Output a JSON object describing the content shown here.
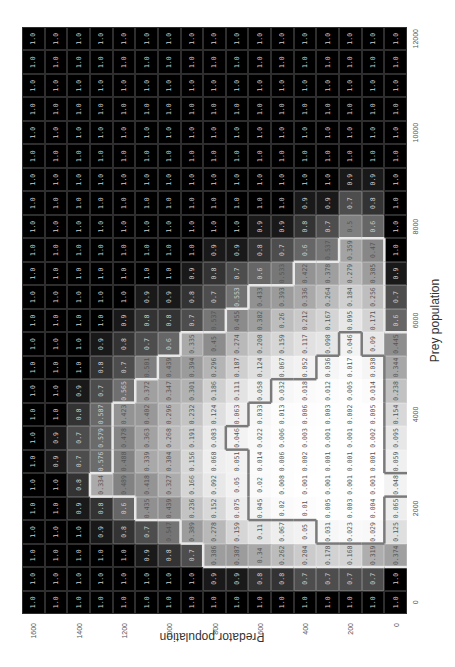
{
  "chart_data": {
    "type": "heatmap",
    "title": "",
    "xlabel": "Prey population",
    "ylabel": "Predator population",
    "x": [
      0,
      500,
      1000,
      1500,
      2000,
      2500,
      3000,
      3500,
      4000,
      4500,
      5000,
      5500,
      6000,
      6500,
      7000,
      7500,
      8000,
      8500,
      9000,
      9500,
      10000,
      10500,
      11000,
      11500,
      12000
    ],
    "y": [
      0,
      100,
      200,
      300,
      400,
      500,
      600,
      700,
      800,
      900,
      1000,
      1100,
      1200,
      1300,
      1400,
      1500,
      1600
    ],
    "xticks": [
      0,
      2000,
      4000,
      6000,
      8000,
      10000,
      12000
    ],
    "yticks": [
      0,
      200,
      400,
      600,
      800,
      1000,
      1200,
      1400,
      1600
    ],
    "colormap": "grayscale (1.0 = black, 0.0 = white)",
    "orientation_note": "figure displayed rotated 90 degrees counter-clockwise",
    "rows_by_predator": {
      "0": [
        1.0,
        1.0,
        0.374,
        0.125,
        0.065,
        0.048,
        0.059,
        0.095,
        0.154,
        0.238,
        0.344,
        0.445,
        0.6,
        0.7,
        0.9,
        1.0,
        1.0,
        1.0,
        1.0,
        1.0,
        1.0,
        1.0,
        1.0,
        1.0,
        1.0
      ],
      "100": [
        1.0,
        0.7,
        0.319,
        0.029,
        0.004,
        0.001,
        0.001,
        0.002,
        0.005,
        0.014,
        0.038,
        0.09,
        0.171,
        0.256,
        0.385,
        0.47,
        0.6,
        0.8,
        0.9,
        1.0,
        1.0,
        1.0,
        1.0,
        1.0,
        1.0
      ],
      "200": [
        1.0,
        0.7,
        0.168,
        0.023,
        0.003,
        0.001,
        0.001,
        0.001,
        0.002,
        0.005,
        0.017,
        0.046,
        0.095,
        0.184,
        0.279,
        0.359,
        0.5,
        0.7,
        0.9,
        1.0,
        1.0,
        1.0,
        1.0,
        1.0,
        1.0
      ],
      "300": [
        1.0,
        0.7,
        0.178,
        0.031,
        0.005,
        0.001,
        0.001,
        0.001,
        0.003,
        0.012,
        0.036,
        0.098,
        0.167,
        0.264,
        0.378,
        0.537,
        0.7,
        0.9,
        1.0,
        1.0,
        1.0,
        1.0,
        1.0,
        1.0,
        1.0
      ],
      "400": [
        1.0,
        0.7,
        0.204,
        0.05,
        0.01,
        0.001,
        0.002,
        0.003,
        0.006,
        0.018,
        0.052,
        0.117,
        0.212,
        0.336,
        0.422,
        0.6,
        0.8,
        0.9,
        1.0,
        1.0,
        1.0,
        1.0,
        1.0,
        1.0,
        1.0
      ],
      "500": [
        1.0,
        0.8,
        0.262,
        0.067,
        0.02,
        0.008,
        0.006,
        0.006,
        0.013,
        0.032,
        0.067,
        0.159,
        0.26,
        0.393,
        0.533,
        0.7,
        0.9,
        1.0,
        1.0,
        1.0,
        1.0,
        1.0,
        1.0,
        1.0,
        1.0
      ],
      "600": [
        1.0,
        0.8,
        0.34,
        0.11,
        0.045,
        0.02,
        0.014,
        0.022,
        0.033,
        0.058,
        0.124,
        0.208,
        0.382,
        0.433,
        0.6,
        0.8,
        0.9,
        1.0,
        1.0,
        1.0,
        1.0,
        1.0,
        1.0,
        1.0,
        1.0
      ],
      "700": [
        1.0,
        0.9,
        0.387,
        0.159,
        0.075,
        0.05,
        0.051,
        0.046,
        0.063,
        0.111,
        0.187,
        0.274,
        0.455,
        0.553,
        0.7,
        0.9,
        1.0,
        1.0,
        1.0,
        1.0,
        1.0,
        1.0,
        1.0,
        1.0,
        1.0
      ],
      "800": [
        1.0,
        0.9,
        0.386,
        0.278,
        0.152,
        0.092,
        0.068,
        0.083,
        0.124,
        0.186,
        0.296,
        0.45,
        0.537,
        0.7,
        0.8,
        0.9,
        1.0,
        1.0,
        1.0,
        1.0,
        1.0,
        1.0,
        1.0,
        1.0,
        1.0
      ],
      "900": [
        1.0,
        1.0,
        0.7,
        0.389,
        0.236,
        0.166,
        0.156,
        0.191,
        0.232,
        0.301,
        0.394,
        0.335,
        0.7,
        0.8,
        0.9,
        1.0,
        1.0,
        1.0,
        1.0,
        1.0,
        1.0,
        1.0,
        1.0,
        1.0,
        1.0
      ],
      "1000": [
        1.0,
        1.0,
        0.8,
        0.547,
        0.439,
        0.327,
        0.304,
        0.268,
        0.296,
        0.347,
        0.439,
        0.6,
        0.8,
        0.9,
        1.0,
        1.0,
        1.0,
        1.0,
        1.0,
        1.0,
        1.0,
        1.0,
        1.0,
        1.0,
        1.0
      ],
      "1100": [
        1.0,
        1.0,
        0.9,
        0.7,
        0.435,
        0.418,
        0.339,
        0.363,
        0.402,
        0.372,
        0.501,
        0.7,
        0.8,
        0.9,
        1.0,
        1.0,
        1.0,
        1.0,
        1.0,
        1.0,
        1.0,
        1.0,
        1.0,
        1.0,
        1.0
      ],
      "1200": [
        1.0,
        1.0,
        1.0,
        0.8,
        0.6,
        0.489,
        0.488,
        0.478,
        0.423,
        0.565,
        0.7,
        0.8,
        0.9,
        1.0,
        1.0,
        1.0,
        1.0,
        1.0,
        1.0,
        1.0,
        1.0,
        1.0,
        1.0,
        1.0,
        1.0
      ],
      "1300": [
        1.0,
        1.0,
        1.0,
        0.9,
        0.8,
        0.334,
        0.576,
        0.579,
        0.587,
        0.7,
        0.8,
        0.9,
        1.0,
        1.0,
        1.0,
        1.0,
        1.0,
        1.0,
        1.0,
        1.0,
        1.0,
        1.0,
        1.0,
        1.0,
        1.0
      ],
      "1400": [
        1.0,
        1.0,
        1.0,
        1.0,
        0.9,
        0.8,
        0.7,
        0.7,
        0.8,
        0.9,
        1.0,
        1.0,
        1.0,
        1.0,
        1.0,
        1.0,
        1.0,
        1.0,
        1.0,
        1.0,
        1.0,
        1.0,
        1.0,
        1.0,
        1.0
      ],
      "1500": [
        1.0,
        1.0,
        1.0,
        1.0,
        1.0,
        1.0,
        0.9,
        0.9,
        1.0,
        1.0,
        1.0,
        1.0,
        1.0,
        1.0,
        1.0,
        1.0,
        1.0,
        1.0,
        1.0,
        1.0,
        1.0,
        1.0,
        1.0,
        1.0,
        1.0
      ],
      "1600": [
        1.0,
        1.0,
        1.0,
        1.0,
        1.0,
        1.0,
        1.0,
        1.0,
        1.0,
        1.0,
        1.0,
        1.0,
        1.0,
        1.0,
        1.0,
        1.0,
        1.0,
        1.0,
        1.0,
        1.0,
        1.0,
        1.0,
        1.0,
        1.0,
        1.0
      ]
    },
    "outlines": [
      {
        "color": "#7a7a7a",
        "description": "region of lowest values (< 0.05)"
      },
      {
        "color": "#e8e8e8",
        "description": "region of low values (< 0.5)"
      }
    ],
    "grid": true,
    "legend": null
  }
}
